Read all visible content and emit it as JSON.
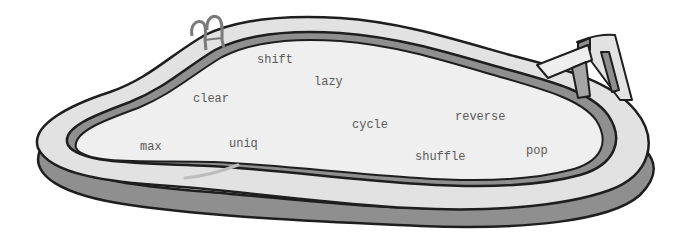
{
  "scene": {
    "description": "Cartoon swimming pool containing floating method names",
    "colors": {
      "water": "#efefef",
      "deck": "#e2e2e2",
      "rim_shadow": "#8f8f8f",
      "outline": "#1e1e1e",
      "text": "#5a5a5a"
    }
  },
  "words": [
    {
      "label": "shift",
      "x": 257,
      "y": 54
    },
    {
      "label": "lazy",
      "x": 314,
      "y": 76
    },
    {
      "label": "clear",
      "x": 193,
      "y": 93
    },
    {
      "label": "reverse",
      "x": 455,
      "y": 111
    },
    {
      "label": "cycle",
      "x": 352,
      "y": 119
    },
    {
      "label": "max",
      "x": 140,
      "y": 141
    },
    {
      "label": "uniq",
      "x": 229,
      "y": 138
    },
    {
      "label": "pop",
      "x": 526,
      "y": 145
    },
    {
      "label": "shuffle",
      "x": 415,
      "y": 151
    }
  ]
}
